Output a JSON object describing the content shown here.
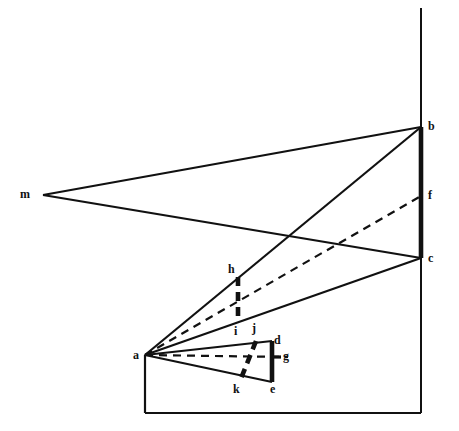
{
  "figure": {
    "type": "geometric-line-diagram",
    "width": 459,
    "height": 431,
    "background_color": "#ffffff",
    "ink_color": "#111111"
  },
  "labels": [
    {
      "id": "m",
      "text": "m",
      "x": 20,
      "y": 188
    },
    {
      "id": "b",
      "text": "b",
      "x": 428,
      "y": 120
    },
    {
      "id": "f",
      "text": "f",
      "x": 428,
      "y": 189
    },
    {
      "id": "c",
      "text": "c",
      "x": 428,
      "y": 252
    },
    {
      "id": "h",
      "text": "h",
      "x": 228,
      "y": 263
    },
    {
      "id": "i",
      "text": "i",
      "x": 234,
      "y": 325
    },
    {
      "id": "j",
      "text": "j",
      "x": 252,
      "y": 322
    },
    {
      "id": "d",
      "text": "d",
      "x": 274,
      "y": 334
    },
    {
      "id": "g",
      "text": "g",
      "x": 283,
      "y": 350
    },
    {
      "id": "a",
      "text": "a",
      "x": 133,
      "y": 349
    },
    {
      "id": "k",
      "text": "k",
      "x": 233,
      "y": 383
    },
    {
      "id": "e",
      "text": "e",
      "x": 270,
      "y": 383
    }
  ],
  "points": {
    "a": {
      "x": 145,
      "y": 355
    },
    "b": {
      "x": 421,
      "y": 127
    },
    "c": {
      "x": 421,
      "y": 258
    },
    "d": {
      "x": 272,
      "y": 341
    },
    "e": {
      "x": 272,
      "y": 382
    },
    "f": {
      "x": 421,
      "y": 196
    },
    "g": {
      "x": 281,
      "y": 357
    },
    "h": {
      "x": 238,
      "y": 277
    },
    "i": {
      "x": 238,
      "y": 322
    },
    "j": {
      "x": 256,
      "y": 341
    },
    "k": {
      "x": 243,
      "y": 378
    },
    "m": {
      "x": 43,
      "y": 195
    }
  },
  "segments": [
    {
      "name": "picture-plane-vertical",
      "from": [
        421,
        8
      ],
      "to": [
        421,
        413
      ],
      "style": "solid",
      "weight": "thin"
    },
    {
      "name": "picture-plane-thick-bc",
      "from": [
        421,
        127
      ],
      "to": [
        421,
        258
      ],
      "style": "solid",
      "weight": "very-thick"
    },
    {
      "name": "m-to-b",
      "from": [
        43,
        195
      ],
      "to": [
        421,
        127
      ],
      "style": "solid",
      "weight": "medium"
    },
    {
      "name": "m-to-c",
      "from": [
        43,
        195
      ],
      "to": [
        421,
        258
      ],
      "style": "solid",
      "weight": "medium"
    },
    {
      "name": "a-to-b",
      "from": [
        145,
        355
      ],
      "to": [
        421,
        127
      ],
      "style": "solid",
      "weight": "medium"
    },
    {
      "name": "a-to-c",
      "from": [
        145,
        355
      ],
      "to": [
        421,
        258
      ],
      "style": "solid",
      "weight": "medium"
    },
    {
      "name": "a-to-f-dashed",
      "from": [
        145,
        355
      ],
      "to": [
        421,
        196
      ],
      "style": "dashed",
      "weight": "medium"
    },
    {
      "name": "a-to-g-dashed",
      "from": [
        145,
        355
      ],
      "to": [
        288,
        357
      ],
      "style": "dashed",
      "weight": "medium"
    },
    {
      "name": "a-to-d",
      "from": [
        145,
        355
      ],
      "to": [
        272,
        341
      ],
      "style": "solid",
      "weight": "medium"
    },
    {
      "name": "a-to-e",
      "from": [
        145,
        355
      ],
      "to": [
        272,
        382
      ],
      "style": "solid",
      "weight": "medium"
    },
    {
      "name": "d-to-e-thick",
      "from": [
        272,
        341
      ],
      "to": [
        272,
        382
      ],
      "style": "solid",
      "weight": "very-thick"
    },
    {
      "name": "g-tick",
      "from": [
        272,
        357
      ],
      "to": [
        281,
        357
      ],
      "style": "solid",
      "weight": "thick"
    },
    {
      "name": "h-to-i-thick-dashed",
      "from": [
        238,
        277
      ],
      "to": [
        238,
        322
      ],
      "style": "dashed",
      "weight": "very-thick"
    },
    {
      "name": "j-to-k-thick-dashed",
      "from": [
        256,
        341
      ],
      "to": [
        240,
        381
      ],
      "style": "dashed",
      "weight": "very-thick"
    },
    {
      "name": "ground-left-vertical",
      "from": [
        145,
        355
      ],
      "to": [
        145,
        413
      ],
      "style": "solid",
      "weight": "medium"
    },
    {
      "name": "ground-bottom-horizontal",
      "from": [
        145,
        413
      ],
      "to": [
        421,
        413
      ],
      "style": "solid",
      "weight": "medium"
    }
  ]
}
